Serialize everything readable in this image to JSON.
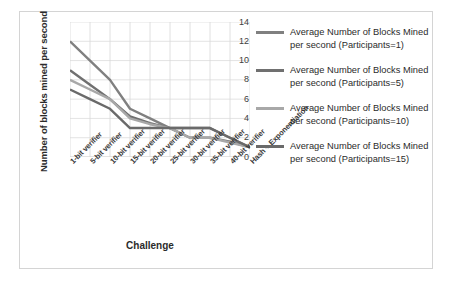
{
  "chart_data": {
    "type": "line",
    "title": "",
    "xlabel": "Challenge",
    "ylabel": "Number of blocks mined per second",
    "ylim": [
      0,
      14
    ],
    "yticks": [
      14,
      12,
      10,
      8,
      6,
      4,
      2,
      0
    ],
    "grid": true,
    "legend_position": "right",
    "categories": [
      "1-bit verifier",
      "5-bit verifier",
      "10-bit verifier",
      "15-bit verifier",
      "20-bit verifier",
      "25-bit verifier",
      "30-bit verifier",
      "35-bit verifier",
      "40-bit verifier",
      "Hash + Exponentiation"
    ],
    "series": [
      {
        "name": "Average Number of Blocks Mined per second (Participants=1)",
        "color": "#808080",
        "values": [
          12,
          10,
          8,
          5,
          4,
          3,
          3,
          3,
          2,
          1
        ]
      },
      {
        "name": "Average Number of Blocks Mined per second (Participants=5)",
        "color": "#707070",
        "values": [
          9,
          7.5,
          6,
          4.2,
          3.5,
          3,
          2,
          2,
          1.6,
          1
        ]
      },
      {
        "name": "Average Number of Blocks Mined per second (Participants=10)",
        "color": "#a8a8a8",
        "values": [
          8,
          7,
          6,
          4,
          3.4,
          3,
          2,
          2,
          1.5,
          1
        ]
      },
      {
        "name": "Average Number of Blocks Mined per second (Participants=15)",
        "color": "#6a6a6a",
        "values": [
          7,
          6,
          5,
          3,
          3,
          3,
          3,
          3,
          2,
          1
        ]
      }
    ]
  },
  "legend": {
    "items": [
      {
        "label": "Average Number of Blocks Mined per second (Participants=1)",
        "color": "#808080"
      },
      {
        "label": "Average Number of Blocks Mined per second (Participants=5)",
        "color": "#707070"
      },
      {
        "label": "Average Number of Blocks Mined per second (Participants=10)",
        "color": "#a8a8a8"
      },
      {
        "label": "Average Number of Blocks Mined per second (Participants=15)",
        "color": "#6a6a6a"
      }
    ]
  },
  "axes": {
    "y_title": "Number of blocks mined per second",
    "x_title": "Challenge"
  }
}
